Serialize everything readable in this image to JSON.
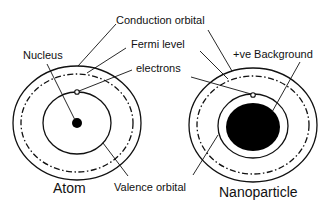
{
  "diagram": {
    "labels": {
      "conduction_orbital": "Conduction orbital",
      "fermi_level": "Fermi level",
      "electrons": "electrons",
      "nucleus": "Nucleus",
      "positive_background": "+ve Background",
      "valence_orbital": "Valence orbital"
    },
    "panels": {
      "atom": {
        "title": "Atom"
      },
      "nanoparticle": {
        "title": "Nanoparticle"
      }
    },
    "colors": {
      "line": "#111111",
      "fill": "#000000",
      "background": "#ffffff"
    }
  }
}
